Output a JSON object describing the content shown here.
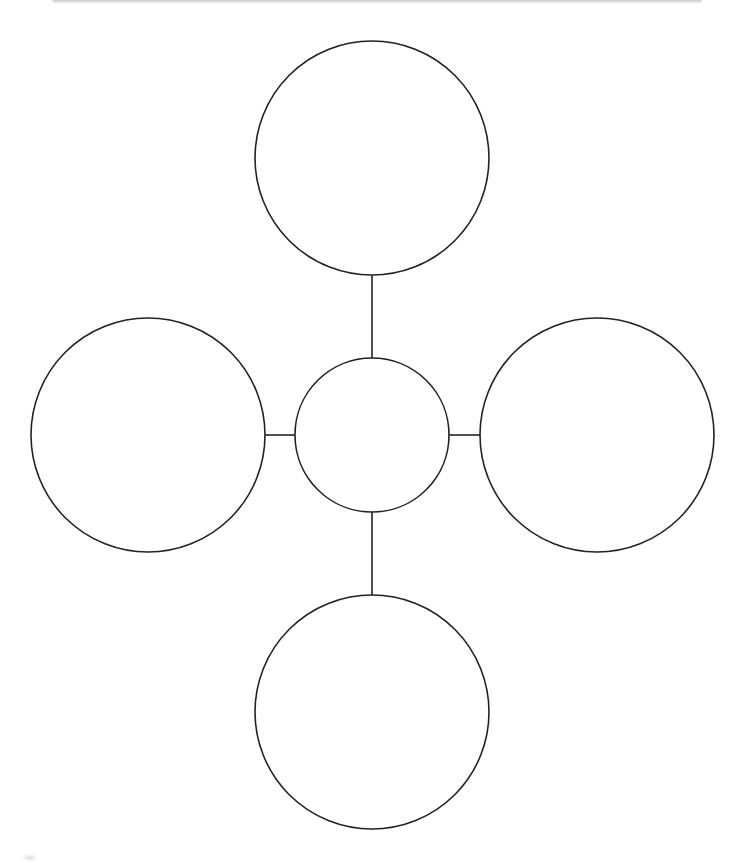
{
  "diagram": {
    "type": "cluster-web",
    "stroke_color": "#222222",
    "stroke_width": 1.6,
    "background": "#ffffff",
    "center_node": {
      "cx": 372,
      "cy": 435,
      "r": 77,
      "label": ""
    },
    "outer_nodes": [
      {
        "id": "top",
        "cx": 372,
        "cy": 158,
        "r": 117,
        "label": ""
      },
      {
        "id": "left",
        "cx": 148,
        "cy": 435,
        "r": 117,
        "label": ""
      },
      {
        "id": "right",
        "cx": 597,
        "cy": 435,
        "r": 117,
        "label": ""
      },
      {
        "id": "bottom",
        "cx": 372,
        "cy": 712,
        "r": 117,
        "label": ""
      }
    ],
    "connectors": [
      {
        "id": "top",
        "x1": 372,
        "y1": 275,
        "x2": 372,
        "y2": 358
      },
      {
        "id": "left",
        "x1": 265,
        "y1": 435,
        "x2": 295,
        "y2": 435
      },
      {
        "id": "right",
        "x1": 449,
        "y1": 435,
        "x2": 480,
        "y2": 435
      },
      {
        "id": "bottom",
        "x1": 372,
        "y1": 512,
        "x2": 372,
        "y2": 595
      }
    ]
  }
}
